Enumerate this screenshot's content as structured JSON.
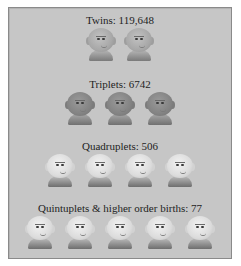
{
  "groups": [
    {
      "label": "Twins: 119,648",
      "count": 2,
      "tone": "medium"
    },
    {
      "label": "Triplets: 6742",
      "count": 3,
      "tone": "dark"
    },
    {
      "label": "Quadruplets: 506",
      "count": 4,
      "tone": "light"
    },
    {
      "label": "Quintuplets & higher order births: 77",
      "count": 5,
      "tone": "light"
    }
  ],
  "icons": {
    "person": "baby-face-icon"
  },
  "colors": {
    "panel_bg": "#c6c6c6",
    "panel_border": "#8a8a8a",
    "text": "#1e1e1e"
  }
}
